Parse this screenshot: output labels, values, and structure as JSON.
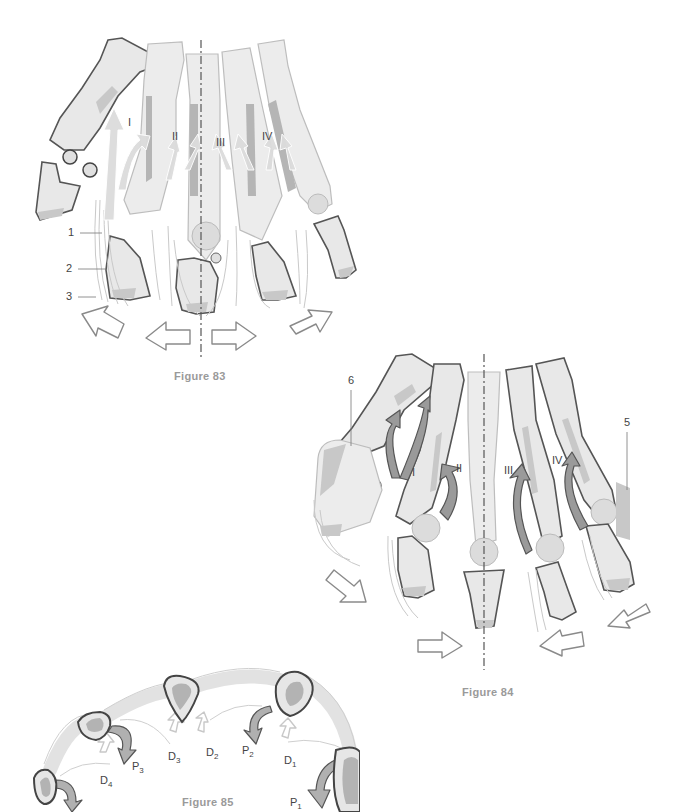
{
  "figures": [
    {
      "id": "figure-83",
      "caption": "Figure 83",
      "digit_labels": [
        "I",
        "II",
        "III",
        "IV"
      ],
      "callouts": [
        "1",
        "2",
        "3"
      ]
    },
    {
      "id": "figure-84",
      "caption": "Figure 84",
      "digit_labels": [
        "I",
        "II",
        "III",
        "IV"
      ],
      "callouts": [
        "5",
        "6"
      ]
    },
    {
      "id": "figure-85",
      "caption": "Figure 85",
      "labels": {
        "D4": {
          "base": "D",
          "sub": "4"
        },
        "P3": {
          "base": "P",
          "sub": "3"
        },
        "D3": {
          "base": "D",
          "sub": "3"
        },
        "D2": {
          "base": "D",
          "sub": "2"
        },
        "P2": {
          "base": "P",
          "sub": "2"
        },
        "D1": {
          "base": "D",
          "sub": "1"
        },
        "P1": {
          "base": "P",
          "sub": "1"
        }
      }
    }
  ],
  "colors": {
    "bone_fill": "#e8e8e8",
    "bone_outline": "#555555",
    "shade": "#c8c8c8",
    "arrow_dark": "#9a9a9a",
    "caption": "#9a9a9a"
  }
}
